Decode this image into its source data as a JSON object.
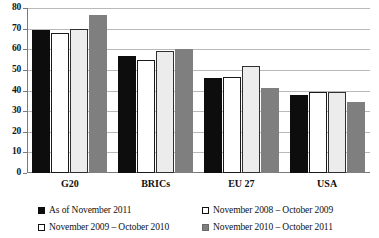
{
  "chart_data": {
    "type": "bar",
    "title": "",
    "subtitle": "",
    "xlabel": "",
    "ylabel": "",
    "ylim": [
      0,
      80
    ],
    "yticks": [
      0,
      10,
      20,
      30,
      40,
      50,
      60,
      70,
      80
    ],
    "ytick_labels": [
      "0",
      "10",
      "20",
      "30",
      "40",
      "50",
      "60",
      "70",
      "80"
    ],
    "grid": "horizontal",
    "legend_position": "bottom",
    "categories": [
      "G20",
      "BRICs",
      "EU 27",
      "USA"
    ],
    "series": [
      {
        "name": "As of November 2011",
        "color": "#0d0d0d",
        "swatch": "filled-black",
        "values": [
          69.5,
          56.8,
          46.0,
          37.6
        ]
      },
      {
        "name": "November 2008 – October 2009",
        "color": "#ffffff",
        "swatch": "outlined-white",
        "values": [
          67.8,
          55.0,
          46.5,
          39.5
        ]
      },
      {
        "name": "November 2009 – October 2010",
        "color": "#ececed",
        "swatch": "outlined-white",
        "values": [
          69.6,
          59.2,
          52.0,
          39.5
        ]
      },
      {
        "name": "November 2010 – October 2011",
        "color": "#7f7f7f",
        "swatch": "filled-gray",
        "values": [
          76.5,
          60.2,
          41.3,
          34.6
        ]
      }
    ]
  }
}
